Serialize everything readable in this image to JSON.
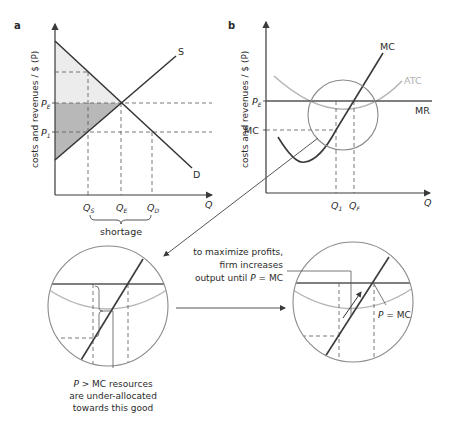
{
  "panels": {
    "a": {
      "label": "a",
      "y_axis_label": "costs and revenues / $ (P)",
      "x_axis_label": "Q",
      "price_labels": {
        "pe": "P",
        "pe_sub": "E",
        "p1": "P",
        "p1_sub": "1"
      },
      "quantity_labels": {
        "qs": "Q",
        "qs_sub": "S",
        "qe": "Q",
        "qe_sub": "E",
        "qd": "Q",
        "qd_sub": "D"
      },
      "curve_labels": {
        "supply": "S",
        "demand": "D"
      },
      "bracket_label": "shortage"
    },
    "b": {
      "label": "b",
      "y_axis_label": "costs and revenues / $ (P)",
      "x_axis_label": "Q",
      "price_labels": {
        "pe": "P",
        "pe_sub": "E",
        "mc": "MC"
      },
      "quantity_labels": {
        "q1": "Q",
        "q1_sub": "1",
        "qf": "Q",
        "qf_sub": "F"
      },
      "curve_labels": {
        "mc": "MC",
        "atc": "ATC",
        "mr": "MR"
      }
    },
    "zoom_left": {
      "annotation_line1": "P > MC resources",
      "annotation_line2": "are under-allocated",
      "annotation_line3": "towards this good"
    },
    "zoom_right": {
      "annotation_line1": "to maximize profits,",
      "annotation_line2": "firm increases",
      "annotation_line3": "output until P = MC",
      "point_label": "P = MC"
    }
  },
  "colors": {
    "line": "#3a3a3a",
    "light_gray_curve": "#b5b5b5",
    "circle": "#8a8a8a",
    "shade_light": "#ececec",
    "shade_dark": "#b8b8b8",
    "dashed": "#555555"
  }
}
